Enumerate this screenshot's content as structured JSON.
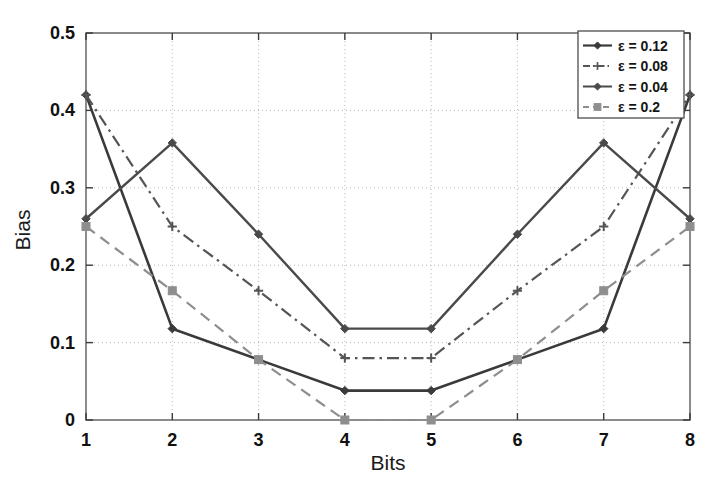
{
  "chart_data": {
    "type": "line",
    "title": "",
    "xlabel": "Bits",
    "ylabel": "Bias",
    "x": [
      1,
      2,
      3,
      4,
      5,
      6,
      7,
      8
    ],
    "xlim": [
      1,
      8
    ],
    "ylim": [
      0,
      0.5
    ],
    "xticks": [
      "1",
      "2",
      "3",
      "4",
      "5",
      "6",
      "7",
      "8"
    ],
    "yticks": [
      "0",
      "0.1",
      "0.2",
      "0.3",
      "0.4",
      "0.5"
    ],
    "ytick_values": [
      0,
      0.1,
      0.2,
      0.3,
      0.4,
      0.5
    ],
    "grid": true,
    "grid_style": "dotted",
    "legend_position": "top-right",
    "series": [
      {
        "name": "ε = 0.12",
        "values": [
          0.42,
          0.118,
          0.078,
          0.038,
          0.038,
          0.078,
          0.118,
          0.42
        ],
        "color": "#3a3a3a",
        "line_style": "solid",
        "marker": "diamond",
        "width": 2.6
      },
      {
        "name": "ε = 0.08",
        "values": [
          0.42,
          0.25,
          0.167,
          0.08,
          0.08,
          0.167,
          0.25,
          0.42
        ],
        "color": "#555555",
        "line_style": "dashdot",
        "marker": "plus",
        "width": 2.2
      },
      {
        "name": "ε = 0.04",
        "values": [
          0.26,
          0.358,
          0.24,
          0.118,
          0.118,
          0.24,
          0.358,
          0.26
        ],
        "color": "#4a4a4a",
        "line_style": "solid",
        "marker": "diamond",
        "width": 2.4
      },
      {
        "name": "ε = 0.2",
        "values": [
          0.25,
          0.167,
          0.078,
          0.0,
          0.0,
          0.078,
          0.167,
          0.25
        ],
        "color": "#8e8e8e",
        "line_style": "dashed",
        "marker": "square",
        "width": 2.2
      }
    ]
  },
  "axes": {
    "xlabel": "Bits",
    "ylabel": "Bias"
  },
  "legend": {
    "entries": [
      {
        "label": "ε = 0.12"
      },
      {
        "label": "ε = 0.08"
      },
      {
        "label": "ε = 0.04"
      },
      {
        "label": "ε = 0.2"
      }
    ]
  }
}
